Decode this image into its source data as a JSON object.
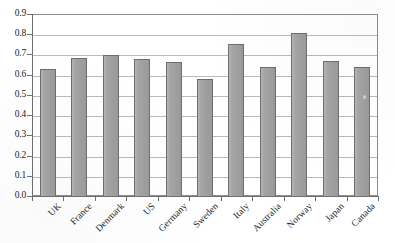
{
  "chart_data": {
    "type": "bar",
    "title": "",
    "subtitle": "",
    "xlabel": "",
    "ylabel": "",
    "categories": [
      "UK",
      "France",
      "Denmark",
      "US",
      "Germany",
      "Sweden",
      "Italy",
      "Australia",
      "Norway",
      "Japan",
      "Canada"
    ],
    "values": [
      0.628,
      0.684,
      0.697,
      0.679,
      0.665,
      0.578,
      0.754,
      0.636,
      0.805,
      0.667,
      0.637
    ],
    "ylim": [
      0.0,
      0.9
    ],
    "ytick_step": 0.1,
    "ytick_labels": [
      "0.0",
      "0.1",
      "0.2",
      "0.3",
      "0.4",
      "0.5",
      "0.6",
      "0.7",
      "0.8",
      "0.9"
    ],
    "grid": true,
    "grid_axis": "y",
    "legend": false,
    "legend_position": "none",
    "bar_color": "#a0a0a0",
    "bar_border_color": "#6d6d6d",
    "gridline_color": "#b9b9b9",
    "axis_color": "#6f6f6f",
    "text_color": "#232323",
    "background_color": "#ffffff",
    "xtick_label_rotation": -45
  }
}
